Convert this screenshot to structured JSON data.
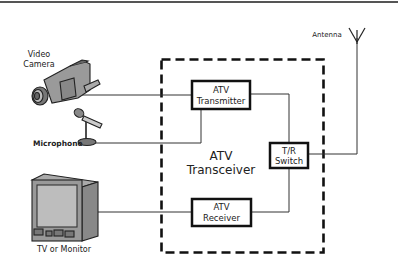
{
  "diagram": {
    "type": "block-diagram",
    "title": "",
    "container": {
      "label_line1": "ATV",
      "label_line2": "Transceiver",
      "style": "dashed"
    },
    "blocks": [
      {
        "id": "transmitter",
        "line1": "ATV",
        "line2": "Transmitter"
      },
      {
        "id": "tr_switch",
        "line1": "T/R",
        "line2": "Switch"
      },
      {
        "id": "receiver",
        "line1": "ATV",
        "line2": "Receiver"
      }
    ],
    "devices": {
      "camera": {
        "line1": "Video",
        "line2": "Camera",
        "icon": "video-camera-icon"
      },
      "microphone": {
        "label": "Microphone",
        "icon": "microphone-icon"
      },
      "tv": {
        "label": "TV or Monitor",
        "icon": "tv-monitor-icon"
      },
      "antenna": {
        "label": "Antenna",
        "icon": "antenna-icon"
      }
    },
    "connections": [
      {
        "from": "Video Camera",
        "to": "ATV Transmitter"
      },
      {
        "from": "Microphone",
        "to": "ATV Transmitter"
      },
      {
        "from": "ATV Transmitter",
        "to": "T/R Switch"
      },
      {
        "from": "T/R Switch",
        "to": "Antenna"
      },
      {
        "from": "T/R Switch",
        "to": "ATV Receiver"
      },
      {
        "from": "ATV Receiver",
        "to": "TV or Monitor"
      }
    ],
    "colors": {
      "line": "#333333",
      "box_border": "#111111",
      "device_fill": "#9a9a9a",
      "device_dark": "#555555",
      "top_rule": "#555555"
    }
  }
}
